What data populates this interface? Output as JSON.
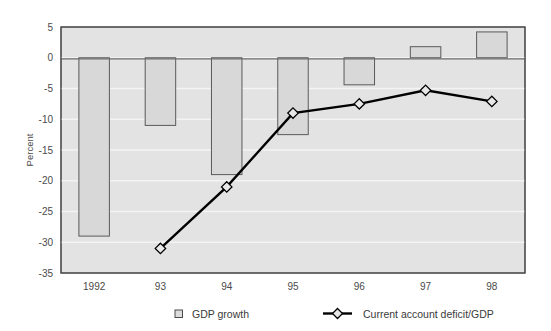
{
  "chart_data": {
    "type": "bar",
    "title": "",
    "subtitle": "",
    "xlabel": "",
    "ylabel": "Percent",
    "categories": [
      "1992",
      "93",
      "94",
      "95",
      "96",
      "97",
      "98"
    ],
    "ylim": [
      -35,
      5
    ],
    "yticks": [
      5,
      0,
      -5,
      -10,
      -15,
      -20,
      -25,
      -30,
      -35
    ],
    "ytick_labels": [
      "5",
      "0",
      "-5",
      "-10",
      "-15",
      "-20",
      "-25",
      "-30",
      "-35"
    ],
    "grid": true,
    "grid_orientation": "horizontal",
    "legend_position": "bottom",
    "plot_background": "#e3e3e3",
    "series": [
      {
        "name": "GDP growth",
        "type": "bar",
        "marker": "square-outline",
        "color": "#d8d8d8",
        "edge_color": "#5a5a5a",
        "values": [
          -29.0,
          -11.0,
          -19.0,
          -12.5,
          -4.4,
          1.8,
          4.2
        ]
      },
      {
        "name": "Current account deficit/GDP",
        "type": "line",
        "marker": "diamond",
        "color": "#000000",
        "marker_fill": "#e8e8e8",
        "x_categories": [
          "93",
          "94",
          "95",
          "96",
          "97",
          "98"
        ],
        "values": [
          null,
          -31.0,
          -21.0,
          -9.0,
          -7.5,
          -5.3,
          -7.1
        ]
      }
    ]
  },
  "legend": {
    "items": [
      {
        "label": "GDP growth",
        "icon": "square-marker-icon"
      },
      {
        "label": "Current account deficit/GDP",
        "icon": "diamond-line-marker-icon"
      }
    ]
  },
  "axes": {
    "y_title": "Percent"
  }
}
